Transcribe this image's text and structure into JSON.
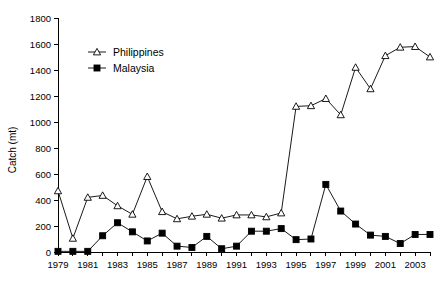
{
  "chart_data": {
    "type": "line",
    "title": "",
    "xlabel": "",
    "ylabel": "Catch (mt)",
    "ylim": [
      0,
      1800
    ],
    "ytick_step": 200,
    "yticks": [
      0,
      200,
      400,
      600,
      800,
      1000,
      1200,
      1400,
      1600,
      1800
    ],
    "xlim": [
      1979,
      2004
    ],
    "xticks_labeled": [
      1979,
      1981,
      1983,
      1985,
      1987,
      1989,
      1991,
      1993,
      1995,
      1997,
      1999,
      2001,
      2003
    ],
    "grid": false,
    "legend_position": "upper-left-inside",
    "x": [
      1979,
      1980,
      1981,
      1982,
      1983,
      1984,
      1985,
      1986,
      1987,
      1988,
      1989,
      1990,
      1991,
      1992,
      1993,
      1994,
      1995,
      1996,
      1997,
      1998,
      1999,
      2000,
      2001,
      2002,
      2003,
      2004
    ],
    "series": [
      {
        "name": "Philippines",
        "marker": "open-triangle",
        "values": [
          470,
          105,
          420,
          435,
          355,
          290,
          580,
          310,
          255,
          275,
          290,
          260,
          285,
          285,
          270,
          300,
          1120,
          1125,
          1180,
          1055,
          1420,
          1255,
          1510,
          1575,
          1580,
          1500
        ]
      },
      {
        "name": "Malaysia",
        "marker": "filled-square",
        "values": [
          5,
          5,
          5,
          125,
          225,
          155,
          85,
          145,
          45,
          35,
          120,
          25,
          45,
          160,
          160,
          180,
          95,
          100,
          520,
          315,
          215,
          130,
          120,
          65,
          135,
          135
        ]
      }
    ]
  },
  "legend": {
    "items": [
      {
        "label": "Philippines",
        "marker": "open-triangle"
      },
      {
        "label": "Malaysia",
        "marker": "filled-square"
      }
    ]
  }
}
